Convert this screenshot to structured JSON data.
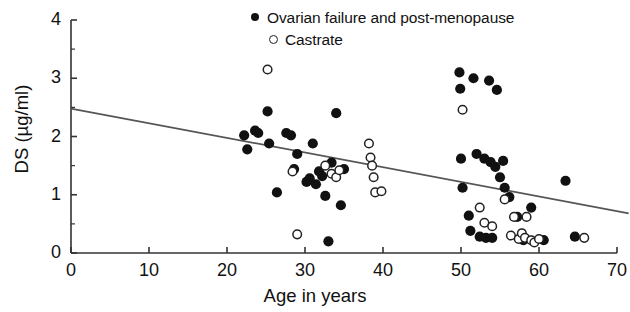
{
  "chart_data": {
    "type": "scatter",
    "title": "",
    "xlabel": "Age in years",
    "ylabel": "DS (µg/ml)",
    "xlim": [
      0,
      70
    ],
    "ylim": [
      0,
      4
    ],
    "xticks": [
      0,
      10,
      20,
      30,
      40,
      50,
      60,
      70
    ],
    "yticks": [
      0,
      1,
      2,
      3,
      4
    ],
    "xtick_labels": [
      "0",
      "10",
      "20",
      "30",
      "40",
      "50",
      "60",
      "70"
    ],
    "ytick_labels": [
      "0",
      "1",
      "2",
      "3",
      "4"
    ],
    "grid": false,
    "legend_position": "top-right",
    "minor_yticks": [
      0.5,
      1.5,
      2.5,
      3.5
    ],
    "series": [
      {
        "name": "Ovarian failure and post-menopause",
        "marker": "filled-circle",
        "color": "#111111",
        "points": [
          [
            22.2,
            2.02
          ],
          [
            22.6,
            1.78
          ],
          [
            23.6,
            2.1
          ],
          [
            24.0,
            2.06
          ],
          [
            25.2,
            2.43
          ],
          [
            25.4,
            1.88
          ],
          [
            26.4,
            1.04
          ],
          [
            27.6,
            2.06
          ],
          [
            28.2,
            2.02
          ],
          [
            28.6,
            1.44
          ],
          [
            29.0,
            1.7
          ],
          [
            30.2,
            1.22
          ],
          [
            30.6,
            1.28
          ],
          [
            31.0,
            1.88
          ],
          [
            31.4,
            1.18
          ],
          [
            31.8,
            1.4
          ],
          [
            32.2,
            1.32
          ],
          [
            32.6,
            0.98
          ],
          [
            33.0,
            0.2
          ],
          [
            33.4,
            1.55
          ],
          [
            34.0,
            2.4
          ],
          [
            34.6,
            0.82
          ],
          [
            35.0,
            1.44
          ],
          [
            49.8,
            3.1
          ],
          [
            49.9,
            2.82
          ],
          [
            51.6,
            3.0
          ],
          [
            53.6,
            2.96
          ],
          [
            54.6,
            2.8
          ],
          [
            50.0,
            1.62
          ],
          [
            50.2,
            1.12
          ],
          [
            51.0,
            0.64
          ],
          [
            51.2,
            0.38
          ],
          [
            52.0,
            1.7
          ],
          [
            52.4,
            0.28
          ],
          [
            53.0,
            1.62
          ],
          [
            53.2,
            0.26
          ],
          [
            53.8,
            1.56
          ],
          [
            54.0,
            0.26
          ],
          [
            54.4,
            1.48
          ],
          [
            55.0,
            1.3
          ],
          [
            55.4,
            1.58
          ],
          [
            55.6,
            1.12
          ],
          [
            56.2,
            0.96
          ],
          [
            57.2,
            0.62
          ],
          [
            58.0,
            0.22
          ],
          [
            59.0,
            0.78
          ],
          [
            60.6,
            0.22
          ],
          [
            63.4,
            1.24
          ],
          [
            64.6,
            0.28
          ]
        ]
      },
      {
        "name": "Castrate",
        "marker": "open-circle",
        "color": "#222222",
        "points": [
          [
            25.2,
            3.15
          ],
          [
            28.4,
            1.4
          ],
          [
            29.0,
            0.32
          ],
          [
            32.6,
            1.5
          ],
          [
            33.4,
            1.36
          ],
          [
            34.0,
            1.3
          ],
          [
            34.4,
            1.42
          ],
          [
            38.2,
            1.88
          ],
          [
            38.4,
            1.64
          ],
          [
            38.6,
            1.5
          ],
          [
            38.8,
            1.3
          ],
          [
            39.0,
            1.04
          ],
          [
            39.8,
            1.06
          ],
          [
            50.2,
            2.46
          ],
          [
            52.4,
            0.78
          ],
          [
            53.0,
            0.52
          ],
          [
            54.0,
            0.46
          ],
          [
            55.6,
            0.92
          ],
          [
            56.4,
            0.3
          ],
          [
            56.8,
            0.62
          ],
          [
            57.4,
            0.24
          ],
          [
            57.8,
            0.34
          ],
          [
            58.2,
            0.26
          ],
          [
            58.4,
            0.62
          ],
          [
            59.0,
            0.22
          ],
          [
            59.4,
            0.18
          ],
          [
            60.0,
            0.24
          ],
          [
            65.8,
            0.26
          ]
        ]
      }
    ],
    "regression_line": {
      "name": "fitted regression line",
      "x": [
        0,
        71.5
      ],
      "y": [
        2.48,
        0.68
      ],
      "color": "#555555"
    }
  },
  "axes": {
    "y_axis_label": "DS (µg/ml)",
    "x_axis_label": "Age in years",
    "y_tick_labels": [
      "4",
      "3",
      "2",
      "1",
      "0"
    ],
    "x_tick_labels": [
      "0",
      "10",
      "20",
      "30",
      "40",
      "50",
      "60",
      "70"
    ]
  },
  "legend": {
    "items": [
      {
        "label": "Ovarian failure and post-menopause",
        "marker": "filled-circle-icon"
      },
      {
        "label": "Castrate",
        "marker": "open-circle-icon"
      }
    ]
  }
}
